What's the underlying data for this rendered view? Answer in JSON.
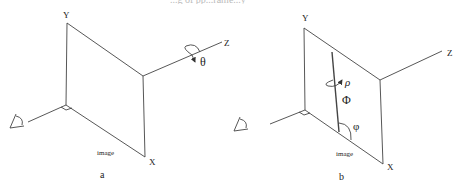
{
  "caption_fragment": "...g of pp...rame...y",
  "panels": [
    {
      "id": "a",
      "label": "a",
      "axes": {
        "x": "X",
        "y": "Y",
        "z": "Z"
      },
      "plane_label": "image",
      "rotation_label": "θ",
      "rotation_axis": "Z"
    },
    {
      "id": "b",
      "label": "b",
      "axes": {
        "x": "X",
        "y": "Y",
        "z": "Z"
      },
      "plane_label": "image",
      "rotation_label": "ρ",
      "line_label": "Φ",
      "angle_label": "φ"
    }
  ],
  "colors": {
    "stroke": "#333333",
    "background": "#ffffff"
  }
}
